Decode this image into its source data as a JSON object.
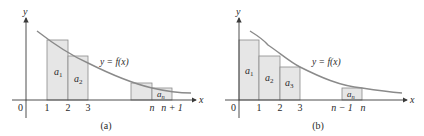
{
  "colors": {
    "axis": "#3a3a3a",
    "curve": "#8a8a8a",
    "rect_fill": "#e6e6e6",
    "rect_stroke": "#8a8a8a",
    "text": "#2a2a2a"
  },
  "panels": [
    {
      "id": "a",
      "caption": "(a)",
      "axis_x_label": "x",
      "axis_y_label": "y",
      "origin_label": "0",
      "curve_label": "y = f(x)",
      "ticks": [
        "1",
        "2",
        "3",
        "n",
        "n + 1"
      ],
      "rect_labels": [
        "a1",
        "a2",
        "an"
      ],
      "rect_labels_display": [
        {
          "base": "a",
          "sub": "1"
        },
        {
          "base": "a",
          "sub": "2"
        },
        {
          "base": "a",
          "sub": "n"
        }
      ]
    },
    {
      "id": "b",
      "caption": "(b)",
      "axis_x_label": "x",
      "axis_y_label": "y",
      "origin_label": "0",
      "curve_label": "y = f(x)",
      "ticks": [
        "1",
        "2",
        "3",
        "n − 1",
        "n"
      ],
      "rect_labels": [
        "a1",
        "a2",
        "a3",
        "an"
      ],
      "rect_labels_display": [
        {
          "base": "a",
          "sub": "1"
        },
        {
          "base": "a",
          "sub": "2"
        },
        {
          "base": "a",
          "sub": "3"
        },
        {
          "base": "a",
          "sub": "n"
        }
      ]
    }
  ]
}
